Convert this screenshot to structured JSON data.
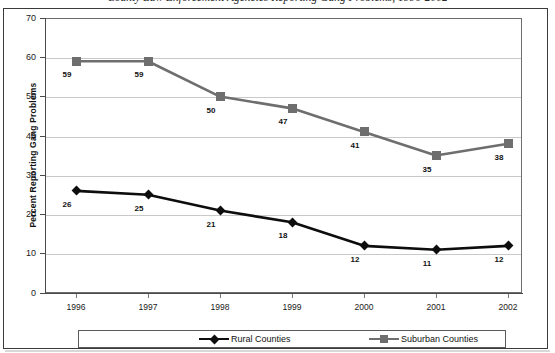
{
  "figure": {
    "title_partial": "County Law Enforcement Agencies Reporting Gang Problems, 1996-2002",
    "colors": {
      "rural": "#0d0d0d",
      "suburban": "#6e6e6e",
      "gridline": "#c9c9c9",
      "axis": "#4a4a4a",
      "frame": "#3a3a3a"
    }
  },
  "chart_data": {
    "type": "line",
    "title": "County Law Enforcement Agencies Reporting Gang Problems, 1996-2002",
    "xlabel": "",
    "ylabel": "Percent Reporting Gang Problems",
    "categories": [
      "1996",
      "1997",
      "1998",
      "1999",
      "2000",
      "2001",
      "2002"
    ],
    "series": [
      {
        "name": "Rural Counties",
        "values": [
          26,
          25,
          21,
          18,
          12,
          11,
          12
        ],
        "color": "#0d0d0d",
        "marker": "diamond"
      },
      {
        "name": "Suburban Counties",
        "values": [
          59,
          59,
          50,
          47,
          41,
          35,
          38
        ],
        "color": "#6e6e6e",
        "marker": "square"
      }
    ],
    "ylim": [
      0,
      70
    ],
    "yticks": [
      0,
      10,
      20,
      30,
      40,
      50,
      60,
      70
    ],
    "ytick_labels": [
      "0",
      "10",
      "20",
      "30",
      "40",
      "50",
      "60",
      "70"
    ],
    "grid": true,
    "grid_axis": "y",
    "legend_position": "bottom",
    "data_labels": true
  },
  "axis": {
    "y_title": "Percent Reporting Gang Problems",
    "y_ticks": [
      "70",
      "60",
      "50",
      "40",
      "30",
      "20",
      "10",
      "0"
    ],
    "x_ticks": [
      "1996",
      "1997",
      "1998",
      "1999",
      "2000",
      "2001",
      "2002"
    ]
  },
  "legend": {
    "rural_label": "Rural Counties",
    "suburban_label": "Suburban Counties"
  },
  "labels": {
    "rural": [
      "26",
      "25",
      "21",
      "18",
      "12",
      "11",
      "12"
    ],
    "suburban": [
      "59",
      "59",
      "50",
      "47",
      "41",
      "35",
      "38"
    ]
  }
}
